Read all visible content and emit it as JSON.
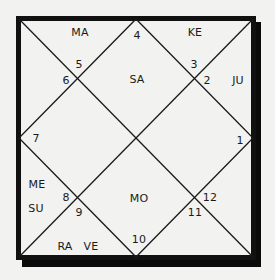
{
  "chart": {
    "type": "North Indian birth chart (rasi chart)",
    "colors": {
      "background": "#f2f2f0",
      "lines": "#1a1a1a",
      "border": "#111111",
      "shadow": "#0a0a0a"
    },
    "house_numbers": {
      "h1": "1",
      "h2": "2",
      "h3": "3",
      "h4": "4",
      "h5": "5",
      "h6": "6",
      "h7": "7",
      "h8": "8",
      "h9": "9",
      "h10": "10",
      "h11": "11",
      "h12": "12"
    },
    "planets": {
      "ma": "MA",
      "ke": "KE",
      "sa": "SA",
      "ju": "JU",
      "me": "ME",
      "su": "SU",
      "mo": "MO",
      "ra": "RA",
      "ve": "VE"
    },
    "placements": [
      {
        "house_region": "top-left triangle",
        "planets": [
          "MA"
        ]
      },
      {
        "house_region": "top-right triangle",
        "planets": [
          "KE"
        ]
      },
      {
        "house_region": "top center diamond",
        "planets": [
          "SA"
        ]
      },
      {
        "house_region": "right-upper triangle",
        "planets": [
          "JU"
        ]
      },
      {
        "house_region": "left-lower triangle",
        "planets": [
          "ME",
          "SU"
        ]
      },
      {
        "house_region": "bottom center diamond",
        "planets": [
          "MO"
        ]
      },
      {
        "house_region": "bottom-left triangle",
        "planets": [
          "RA",
          "VE"
        ]
      }
    ]
  }
}
